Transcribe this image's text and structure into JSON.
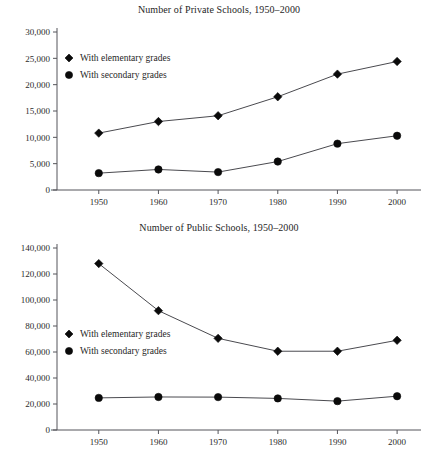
{
  "page": {
    "background": "#ffffff",
    "ink_color": "#1a1a1a",
    "axis_color": "#55555a",
    "marker_color": "#0a0a0a"
  },
  "charts": [
    {
      "id": "private-schools",
      "title": "Number of Private Schools, 1950–2000",
      "legend": [
        {
          "marker": "diamond",
          "label": "With elementary grades"
        },
        {
          "marker": "circle",
          "label": "With secondary grades"
        }
      ],
      "ytick_labels": [
        "0",
        "5,000",
        "10,000",
        "15,000",
        "20,000",
        "25,000",
        "30,000"
      ],
      "xtick_labels": [
        "1950",
        "1960",
        "1970",
        "1980",
        "1990",
        "2000"
      ]
    },
    {
      "id": "public-schools",
      "title": "Number of Public Schools, 1950–2000",
      "legend": [
        {
          "marker": "diamond",
          "label": "With elementary grades"
        },
        {
          "marker": "circle",
          "label": "With secondary grades"
        }
      ],
      "ytick_labels": [
        "0",
        "20,000",
        "40,000",
        "60,000",
        "80,000",
        "100,000",
        "120,000",
        "140,000"
      ],
      "xtick_labels": [
        "1950",
        "1960",
        "1970",
        "1980",
        "1990",
        "2000"
      ]
    }
  ],
  "chart_data": [
    {
      "type": "line",
      "title": "Number of Private Schools, 1950–2000",
      "xlabel": "",
      "ylabel": "",
      "x": [
        1950,
        1960,
        1970,
        1980,
        1990,
        2000
      ],
      "categories": [
        "1950",
        "1960",
        "1970",
        "1980",
        "1990",
        "2000"
      ],
      "series": [
        {
          "name": "With elementary grades",
          "marker": "diamond",
          "values": [
            10800,
            13000,
            14100,
            17700,
            22000,
            24400
          ]
        },
        {
          "name": "With secondary grades",
          "marker": "circle",
          "values": [
            3200,
            3900,
            3400,
            5400,
            8800,
            10300
          ]
        }
      ],
      "ylim": [
        0,
        30000
      ],
      "yticks": [
        0,
        5000,
        10000,
        15000,
        20000,
        25000,
        30000
      ],
      "ytick_labels": [
        "0",
        "5,000",
        "10,000",
        "15,000",
        "20,000",
        "25,000",
        "30,000"
      ],
      "xlim": [
        1943,
        2003
      ],
      "xticks": [
        1950,
        1960,
        1970,
        1980,
        1990,
        2000
      ],
      "grid": false,
      "legend_position": "upper left"
    },
    {
      "type": "line",
      "title": "Number of Public Schools, 1950–2000",
      "xlabel": "",
      "ylabel": "",
      "x": [
        1950,
        1960,
        1970,
        1980,
        1990,
        2000
      ],
      "categories": [
        "1950",
        "1960",
        "1970",
        "1980",
        "1990",
        "2000"
      ],
      "series": [
        {
          "name": "With elementary grades",
          "marker": "diamond",
          "values": [
            128000,
            91800,
            70500,
            60600,
            60600,
            69000
          ]
        },
        {
          "name": "With secondary grades",
          "marker": "circle",
          "values": [
            24700,
            25400,
            25300,
            24300,
            22200,
            26000
          ]
        }
      ],
      "ylim": [
        0,
        140000
      ],
      "yticks": [
        0,
        20000,
        40000,
        60000,
        80000,
        100000,
        120000,
        140000
      ],
      "ytick_labels": [
        "0",
        "20,000",
        "40,000",
        "60,000",
        "80,000",
        "100,000",
        "120,000",
        "140,000"
      ],
      "xlim": [
        1943,
        2003
      ],
      "xticks": [
        1950,
        1960,
        1970,
        1980,
        1990,
        2000
      ],
      "grid": false,
      "legend_position": "middle left"
    }
  ]
}
